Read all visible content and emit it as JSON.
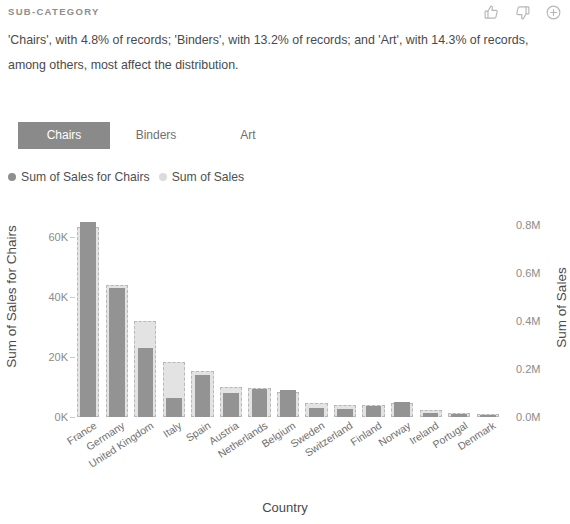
{
  "header": {
    "title": "SUB-CATEGORY",
    "icons": [
      {
        "name": "thumbs-up-icon",
        "label": "Like"
      },
      {
        "name": "thumbs-down-icon",
        "label": "Dislike"
      },
      {
        "name": "add-circle-icon",
        "label": "Add"
      }
    ]
  },
  "description": "'Chairs', with 4.8% of records; 'Binders', with 13.2% of records; and 'Art', with 14.3% of records, among others, most affect the distribution.",
  "tabs": [
    {
      "label": "Chairs",
      "active": true
    },
    {
      "label": "Binders",
      "active": false
    },
    {
      "label": "Art",
      "active": false
    }
  ],
  "legend": [
    {
      "label": "Sum of Sales for Chairs",
      "color": "#8f8f8f"
    },
    {
      "label": "Sum of Sales",
      "color": "#dcdcdc"
    }
  ],
  "colors": {
    "front_bar": "#939393",
    "back_bar": "#e3e3e3",
    "back_bar_outline": "#b8b8b8",
    "active_tab_bg": "#8a8a8a",
    "axis_text": "#8b8b8b",
    "body_text": "#4a4a4a"
  },
  "chart_data": {
    "type": "bar",
    "title": "",
    "xlabel": "Country",
    "categories": [
      "France",
      "Germany",
      "United Kingdom",
      "Italy",
      "Spain",
      "Austria",
      "Netherlands",
      "Belgium",
      "Sweden",
      "Switzerland",
      "Finland",
      "Norway",
      "Ireland",
      "Portugal",
      "Denmark"
    ],
    "series": [
      {
        "name": "Sum of Sales for Chairs",
        "axis": "left",
        "ylabel": "Sum of Sales for Chairs",
        "ylim": [
          0,
          70000
        ],
        "ticks": [
          "0K",
          "20K",
          "40K",
          "60K"
        ],
        "tick_values": [
          0,
          20000,
          40000,
          60000
        ],
        "color": "#939393",
        "values": [
          65000,
          43000,
          23000,
          6500,
          14000,
          8000,
          9500,
          9000,
          3000,
          2600,
          3600,
          5000,
          1500,
          900,
          600
        ]
      },
      {
        "name": "Sum of Sales",
        "axis": "right",
        "ylabel": "Sum of Sales",
        "ylim": [
          0,
          0.875
        ],
        "ticks": [
          "0.0M",
          "0.2M",
          "0.4M",
          "0.6M",
          "0.8M"
        ],
        "tick_values": [
          0.0,
          0.2,
          0.4,
          0.6,
          0.8
        ],
        "color": "#e3e3e3",
        "values": [
          0.79,
          0.55,
          0.4,
          0.23,
          0.19,
          0.125,
          0.12,
          0.105,
          0.06,
          0.05,
          0.048,
          0.06,
          0.028,
          0.018,
          0.012
        ]
      }
    ],
    "grid": false,
    "legend_position": "top-left"
  }
}
